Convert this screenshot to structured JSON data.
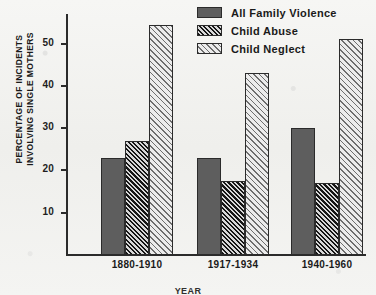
{
  "chart_data": {
    "type": "bar",
    "title": "",
    "xlabel": "YEAR",
    "ylabel": "PERCENTAGE OF INCIDENTS INVOLVING SINGLE MOTHERS",
    "ylabel_line1": "PERCENTAGE OF INCIDENTS",
    "ylabel_line2": "INVOLVING SINGLE MOTHERS",
    "categories": [
      "1880-1910",
      "1917-1934",
      "1940-1960"
    ],
    "series": [
      {
        "name": "All Family Violence",
        "pattern": "solid",
        "color": "#5e5e5e",
        "values": [
          23,
          23,
          30
        ]
      },
      {
        "name": "Child Abuse",
        "pattern": "densehatch",
        "color": "#161616",
        "values": [
          27,
          17.5,
          17
        ]
      },
      {
        "name": "Child Neglect",
        "pattern": "lighthatch",
        "color": "#6e6e6e",
        "values": [
          54.5,
          43,
          51
        ]
      }
    ],
    "ylim": [
      0,
      57
    ],
    "yticks": [
      10,
      20,
      30,
      40,
      50
    ],
    "ytick_labels": [
      "10",
      "20",
      "30",
      "40",
      "50"
    ],
    "grid": false,
    "legend_position": "top-right"
  },
  "legend": {
    "items": [
      {
        "label": "All Family Violence",
        "pattern": "solid"
      },
      {
        "label": "Child Abuse",
        "pattern": "densehatch"
      },
      {
        "label": "Child Neglect",
        "pattern": "lighthatch"
      }
    ]
  }
}
